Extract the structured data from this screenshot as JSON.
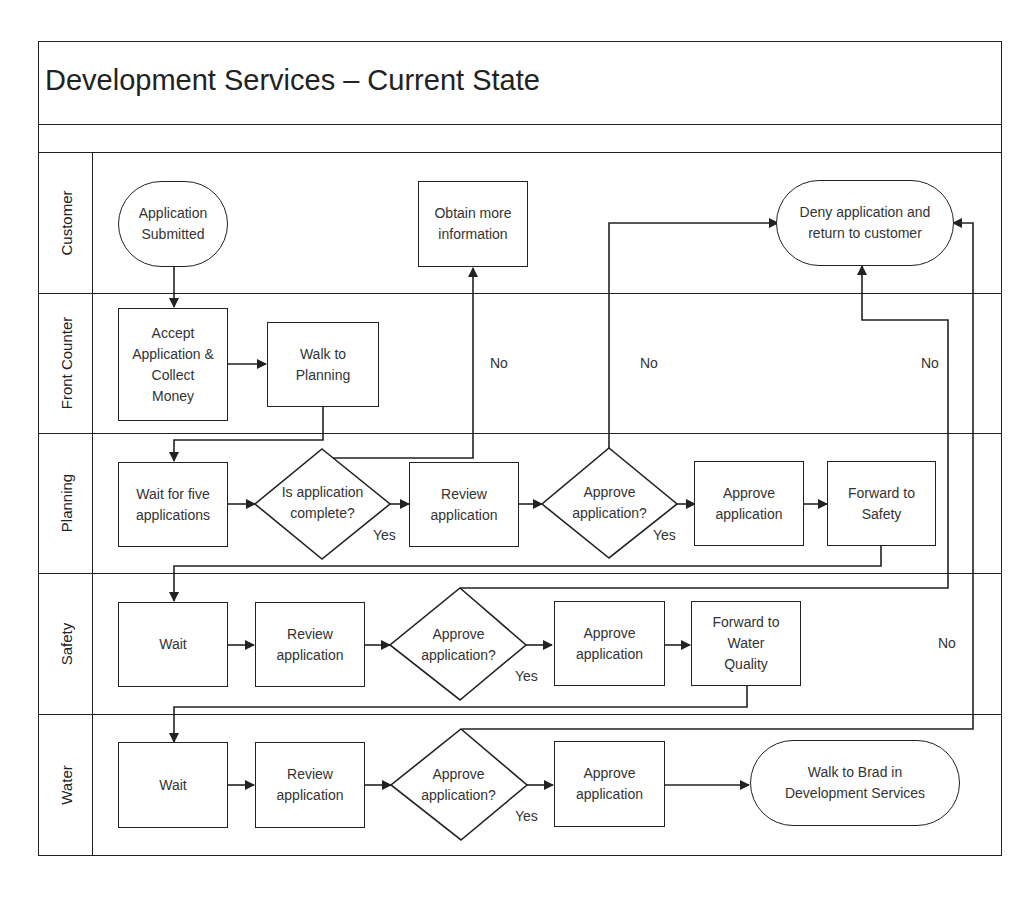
{
  "title": "Development Services – Current State",
  "lanes": [
    {
      "label": "Customer"
    },
    {
      "label": "Front Counter"
    },
    {
      "label": "Planning"
    },
    {
      "label": "Safety"
    },
    {
      "label": "Water"
    }
  ],
  "nodes": {
    "app_submitted": "Application\nSubmitted",
    "obtain_info": "Obtain more\ninformation",
    "deny": "Deny application and\nreturn to customer",
    "accept_collect": "Accept\nApplication &\nCollect\nMoney",
    "walk_planning": "Walk to\nPlanning",
    "wait_five": "Wait for five\napplications",
    "is_complete": "Is application\ncomplete?",
    "plan_review": "Review\napplication",
    "plan_approve_q": "Approve\napplication?",
    "plan_approve": "Approve\napplication",
    "fwd_safety": "Forward to\nSafety",
    "safety_wait": "Wait",
    "safety_review": "Review\napplication",
    "safety_approve_q": "Approve\napplication?",
    "safety_approve": "Approve\napplication",
    "fwd_water": "Forward to\nWater\nQuality",
    "water_wait": "Wait",
    "water_review": "Review\napplication",
    "water_approve_q": "Approve\napplication?",
    "water_approve": "Approve\napplication",
    "walk_brad": "Walk to Brad in\nDevelopment Services"
  },
  "edge_labels": {
    "complete_no": "No",
    "complete_yes": "Yes",
    "plan_no": "No",
    "plan_yes": "Yes",
    "safety_no": "No",
    "safety_yes": "Yes",
    "water_no": "No",
    "water_yes": "Yes"
  }
}
